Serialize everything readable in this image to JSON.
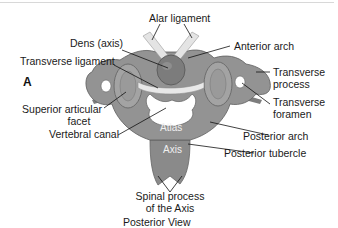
{
  "diagram": {
    "figure_letter": "A",
    "caption": "Posterior View",
    "colors": {
      "bone": "#8e8e8e",
      "bone_light": "#b4b4b4",
      "bone_dark": "#6a6a6a",
      "ligament": "#e6e6e6",
      "leader_line": "#111111",
      "text": "#1a1a1a"
    },
    "labels": {
      "alar_ligament": "Alar ligament",
      "dens": "Dens (axis)",
      "anterior_arch": "Anterior arch",
      "transverse_ligament": "Transverse ligament",
      "transverse_process_1": "Transverse",
      "transverse_process_2": "process",
      "superior_articular_1": "Superior articular",
      "superior_articular_2": "facet",
      "transverse_foramen_1": "Transverse",
      "transverse_foramen_2": "foramen",
      "vertebral_canal": "Vertebral canal",
      "atlas": "Atlas",
      "posterior_arch": "Posterior arch",
      "axis": "Axis",
      "posterior_tubercle": "Posterior tubercle",
      "spinal_process_1": "Spinal process",
      "spinal_process_2": "of the Axis"
    }
  }
}
